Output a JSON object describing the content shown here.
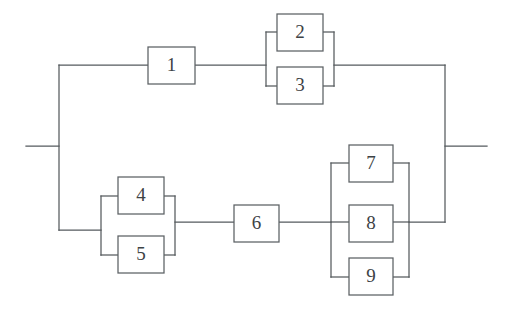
{
  "diagram": {
    "type": "reliability-block-diagram",
    "title": "",
    "canvas": {
      "width": 509,
      "height": 316,
      "background": "#ffffff"
    },
    "colors": {
      "line": "#555a5e",
      "block_stroke": "#5b6064",
      "block_fill": "#ffffff",
      "label": "#3d4245"
    },
    "blocks": [
      {
        "id": "block-1",
        "label": "1",
        "x": 148,
        "y": 47,
        "w": 47,
        "h": 37
      },
      {
        "id": "block-2",
        "label": "2",
        "x": 277,
        "y": 14,
        "w": 46,
        "h": 37
      },
      {
        "id": "block-3",
        "label": "3",
        "x": 277,
        "y": 67,
        "w": 46,
        "h": 37
      },
      {
        "id": "block-4",
        "label": "4",
        "x": 118,
        "y": 177,
        "w": 46,
        "h": 37
      },
      {
        "id": "block-5",
        "label": "5",
        "x": 118,
        "y": 236,
        "w": 46,
        "h": 37
      },
      {
        "id": "block-6",
        "label": "6",
        "x": 234,
        "y": 205,
        "w": 45,
        "h": 37
      },
      {
        "id": "block-7",
        "label": "7",
        "x": 349,
        "y": 145,
        "w": 44,
        "h": 37
      },
      {
        "id": "block-8",
        "label": "8",
        "x": 349,
        "y": 205,
        "w": 44,
        "h": 37
      },
      {
        "id": "block-9",
        "label": "9",
        "x": 349,
        "y": 258,
        "w": 44,
        "h": 37
      }
    ],
    "groups": [
      {
        "id": "parallel-2-3",
        "members": [
          "2",
          "3"
        ],
        "left_bracket_x": 266,
        "right_bracket_x": 334
      },
      {
        "id": "parallel-4-5",
        "members": [
          "4",
          "5"
        ],
        "left_bracket_x": 101,
        "right_bracket_x": 175
      },
      {
        "id": "parallel-7-8-9",
        "members": [
          "7",
          "8",
          "9"
        ],
        "left_bracket_x": 331,
        "right_bracket_x": 409
      }
    ],
    "rails": {
      "input_stub": {
        "x1": 26,
        "y1": 146,
        "x2": 59,
        "y2": 146
      },
      "output_stub": {
        "x1": 445,
        "y1": 146,
        "x2": 487,
        "y2": 146
      },
      "left_rail_x": 59,
      "right_rail_x": 445,
      "top_branch_y": 65,
      "bottom_branch_y": 222,
      "left_rail_bottom_y": 230
    },
    "paths": [
      "M26,146 H59",
      "M59,65 V230",
      "M59,65 H148",
      "M195,65 H266",
      "M334,65 H445",
      "M59,230 H101",
      "M175,222 H234",
      "M279,222 H331",
      "M409,222 H445",
      "M445,65 V222",
      "M445,146 H487",
      "M266,32 V86",
      "M266,32 H277",
      "M266,86 H277",
      "M323,32 H334",
      "M323,86 H334",
      "M334,32 V86",
      "M266,65 H277",
      "M323,65 H334",
      "M101,196 V255",
      "M101,196 H118",
      "M101,255 H118",
      "M164,196 H175",
      "M164,255 H175",
      "M175,196 V255",
      "M101,230 H118",
      "M331,163 V277",
      "M331,163 H349",
      "M331,277 H349",
      "M393,163 H409",
      "M393,277 H409",
      "M409,163 V277",
      "M331,222 H349",
      "M393,222 H409"
    ]
  }
}
